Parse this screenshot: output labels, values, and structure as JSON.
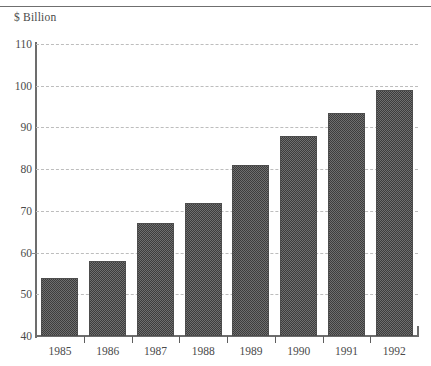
{
  "chart_data": {
    "type": "bar",
    "title": "$ Billion",
    "xlabel": "",
    "ylabel": "$ Billion",
    "categories": [
      "1985",
      "1986",
      "1987",
      "1988",
      "1989",
      "1990",
      "1991",
      "1992"
    ],
    "values": [
      54,
      58,
      67,
      72,
      81,
      88,
      93.5,
      99
    ],
    "ylim": [
      40,
      110
    ],
    "yticks": [
      40,
      50,
      60,
      70,
      80,
      90,
      100,
      110
    ],
    "ytick_labels": [
      "40",
      "50",
      "60",
      "70",
      "80",
      "90",
      "100",
      "110"
    ],
    "grid": true,
    "grid_style": "dashed",
    "legend": false,
    "bar_fill": "#6e6e6e",
    "bar_pattern": "checkered-dither",
    "bar_edge_color": "#4d4d4d",
    "grid_color": "#bdbdbd",
    "axis_color": "#6d6d6d",
    "text_color": "#4a4a4a"
  }
}
